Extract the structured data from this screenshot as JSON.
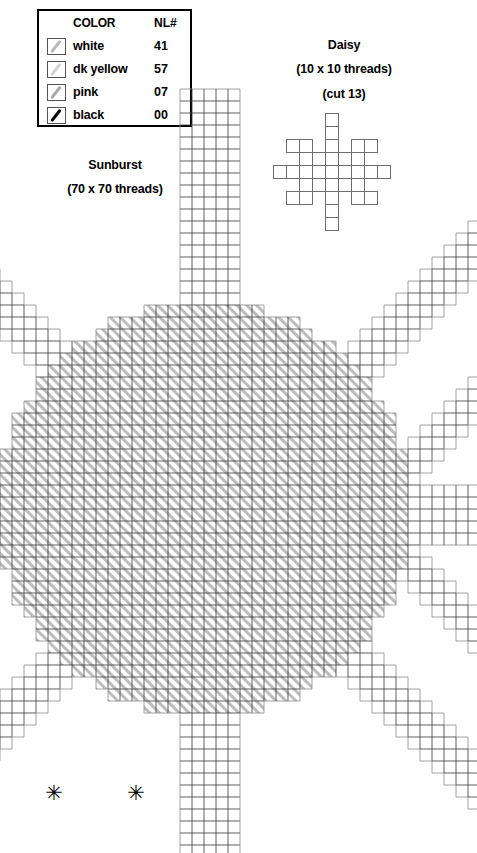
{
  "legend": {
    "headers": {
      "color": "COLOR",
      "code": "NL#"
    },
    "rows": [
      {
        "swatch": "white-swatch-icon",
        "name": "white",
        "code": "41"
      },
      {
        "swatch": "dk-yellow-swatch-icon",
        "name": "dk yellow",
        "code": "57"
      },
      {
        "swatch": "pink-swatch-icon",
        "name": "pink",
        "code": "07"
      },
      {
        "swatch": "black-swatch-icon",
        "name": "black",
        "code": "00"
      }
    ]
  },
  "daisy": {
    "title": "Daisy",
    "size": "(10 x 10 threads)",
    "cut": "(cut 13)"
  },
  "sunburst": {
    "title": "Sunburst",
    "size": "(70 x 70 threads)"
  },
  "chart_data": {
    "type": "table",
    "xlabel": "",
    "ylabel": "",
    "grid": true,
    "legend_position": "top-left",
    "colors": [
      "#ffffff",
      "#d2d2d2",
      "#a8a8a8",
      "#000000"
    ],
    "charts": [
      {
        "name": "Daisy",
        "grid_w": 10,
        "grid_h": 10,
        "cell_px": 13,
        "cut_count": 13,
        "filled_cells": [
          [
            4,
            0
          ],
          [
            4,
            1
          ],
          [
            1,
            2
          ],
          [
            2,
            2
          ],
          [
            4,
            2
          ],
          [
            6,
            2
          ],
          [
            7,
            2
          ],
          [
            2,
            3
          ],
          [
            3,
            3
          ],
          [
            4,
            3
          ],
          [
            5,
            3
          ],
          [
            6,
            3
          ],
          [
            0,
            4
          ],
          [
            1,
            4
          ],
          [
            2,
            4
          ],
          [
            3,
            4
          ],
          [
            4,
            4
          ],
          [
            5,
            4
          ],
          [
            6,
            4
          ],
          [
            7,
            4
          ],
          [
            8,
            4
          ],
          [
            2,
            5
          ],
          [
            3,
            5
          ],
          [
            4,
            5
          ],
          [
            5,
            5
          ],
          [
            6,
            5
          ],
          [
            1,
            6
          ],
          [
            2,
            6
          ],
          [
            4,
            6
          ],
          [
            6,
            6
          ],
          [
            7,
            6
          ],
          [
            4,
            7
          ],
          [
            4,
            8
          ]
        ]
      },
      {
        "name": "Sunburst",
        "grid_w": 70,
        "grid_h": 70,
        "cell_px": 12,
        "center_symbols": 2,
        "symbol_glyph": "✳",
        "regions": [
          {
            "id": "center-disc",
            "fill": "hatch-diagonal",
            "color": "#a8a8a8"
          },
          {
            "id": "rays",
            "fill": "outline",
            "color": "#ffffff"
          },
          {
            "id": "right-diamond",
            "fill": "outline",
            "color": "#ffffff"
          }
        ]
      }
    ]
  }
}
